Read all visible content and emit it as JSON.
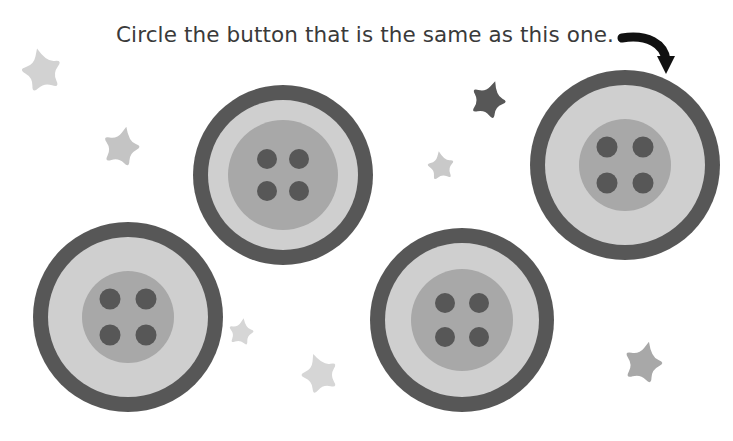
{
  "page": {
    "title": "Circle the button that is the same as this one.",
    "width": 733,
    "height": 441,
    "background_color": "#ffffff"
  },
  "instruction": {
    "text": "Circle the button that is the same as this one.",
    "color": "#3a3a3a",
    "x": 116,
    "y": 42,
    "font_size": 21.5
  },
  "arrow": {
    "name": "curved-arrow-down-right",
    "color": "#111111",
    "path": "M 622 38 C 648 34, 664 44, 666 60",
    "stroke_width": 9,
    "head_points": "657,56 675,56 666,74",
    "description": "Curved black arrow pointing from the sentence down to the reference button"
  },
  "colors": {
    "button_ring": "#575757",
    "button_body": "#cfcfcf",
    "button_inner": "#a8a8a8",
    "button_hole": "#575757",
    "star_light": "#d2d2d2",
    "star_medium": "#a8a8a8",
    "star_dark": "#575757",
    "text": "#3a3a3a",
    "arrow": "#111111"
  },
  "buttons": [
    {
      "id": "reference-button",
      "label": "Reference button (top right)",
      "position": "top-right",
      "is_reference": true,
      "is_match": false,
      "cx": 625,
      "cy": 165,
      "outer_r": 95,
      "ring_width": 15,
      "inner_r": 46,
      "hole_r": 10.5,
      "hole_offset": 18,
      "ring_color": "#575757",
      "body_color": "#cfcfcf",
      "inner_color": "#a8a8a8",
      "hole_color": "#575757"
    },
    {
      "id": "button-top-middle",
      "label": "Button top middle",
      "position": "top-middle",
      "is_reference": false,
      "is_match": false,
      "cx": 283,
      "cy": 175,
      "outer_r": 90,
      "ring_width": 15,
      "inner_r": 55,
      "hole_r": 10,
      "hole_offset": 16,
      "ring_color": "#575757",
      "body_color": "#cfcfcf",
      "inner_color": "#a8a8a8",
      "hole_color": "#575757"
    },
    {
      "id": "button-bottom-left",
      "label": "Button bottom left",
      "position": "bottom-left",
      "is_reference": false,
      "is_match": true,
      "cx": 128,
      "cy": 317,
      "outer_r": 95,
      "ring_width": 15,
      "inner_r": 46,
      "hole_r": 10.5,
      "hole_offset": 18,
      "ring_color": "#575757",
      "body_color": "#cfcfcf",
      "inner_color": "#a8a8a8",
      "hole_color": "#575757"
    },
    {
      "id": "button-bottom-middle",
      "label": "Button bottom middle",
      "position": "bottom-middle",
      "is_reference": false,
      "is_match": false,
      "cx": 462,
      "cy": 320,
      "outer_r": 92,
      "ring_width": 15,
      "inner_r": 51,
      "hole_r": 10,
      "hole_offset": 17,
      "ring_color": "#575757",
      "body_color": "#cfcfcf",
      "inner_color": "#a8a8a8",
      "hole_color": "#575757"
    }
  ],
  "stars": [
    {
      "id": "star-top-left",
      "cx": 42,
      "cy": 72,
      "r": 24,
      "rotation": -12,
      "color": "#d2d2d2"
    },
    {
      "id": "star-upper-left-two",
      "cx": 121,
      "cy": 148,
      "r": 22,
      "rotation": 14,
      "color": "#c4c4c4"
    },
    {
      "id": "star-dark-center",
      "cx": 488,
      "cy": 101,
      "r": 21,
      "rotation": 20,
      "color": "#575757"
    },
    {
      "id": "star-center-small",
      "cx": 441,
      "cy": 167,
      "r": 16,
      "rotation": -8,
      "color": "#c9c9c9"
    },
    {
      "id": "star-bottom-left-mid",
      "cx": 241,
      "cy": 333,
      "r": 15,
      "rotation": 10,
      "color": "#d6d6d6"
    },
    {
      "id": "star-bottom-center",
      "cx": 320,
      "cy": 375,
      "r": 22,
      "rotation": -18,
      "color": "#d6d6d6"
    },
    {
      "id": "star-bottom-right",
      "cx": 643,
      "cy": 364,
      "r": 23,
      "rotation": 15,
      "color": "#a8a8a8"
    }
  ]
}
